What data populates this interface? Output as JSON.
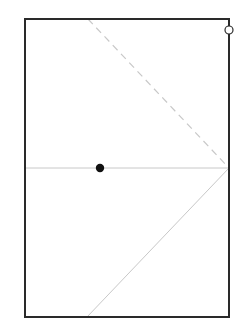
{
  "diagram": {
    "width": 241,
    "height": 335,
    "background": "#ffffff",
    "frame": {
      "x": 25,
      "y": 19,
      "width": 204,
      "height": 298,
      "stroke": "#2a2a2a",
      "stroke_width": 2
    },
    "horizontal_line": {
      "x1": 25,
      "y1": 168,
      "x2": 229,
      "y2": 168,
      "stroke": "#c8c8c8",
      "stroke_width": 1
    },
    "dashed_line": {
      "x1": 88,
      "y1": 19,
      "x2": 229,
      "y2": 168,
      "stroke": "#c8c8c8",
      "stroke_width": 1.2,
      "dasharray": "7,5"
    },
    "lower_diagonal": {
      "x1": 229,
      "y1": 168,
      "x2": 87,
      "y2": 317,
      "stroke": "#c8c8c8",
      "stroke_width": 1
    },
    "filled_point": {
      "cx": 100,
      "cy": 168,
      "r": 4.2,
      "fill": "#111111"
    },
    "hollow_point": {
      "cx": 229,
      "cy": 30,
      "r": 4,
      "stroke": "#2a2a2a",
      "stroke_width": 1.2,
      "fill": "#ffffff"
    }
  }
}
